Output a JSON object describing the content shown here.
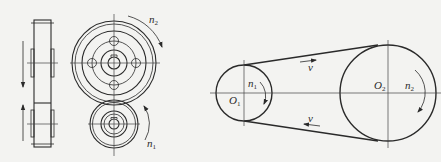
{
  "figure": {
    "colors": {
      "background": "#f3f3f1",
      "ink": "#2a2a2a"
    },
    "gear_pair": {
      "side_view": {
        "arrows": [
          {
            "direction": "down"
          },
          {
            "direction": "up"
          }
        ]
      },
      "front_view": {
        "large_gear": {
          "speed_label": "n",
          "speed_sub": "2",
          "rotation": "clockwise"
        },
        "small_gear": {
          "speed_label": "n",
          "speed_sub": "1",
          "rotation": "counterclockwise"
        }
      }
    },
    "belt_drive": {
      "driver_pulley": {
        "center_label": "O",
        "center_sub": "1",
        "speed_label": "n",
        "speed_sub": "1",
        "rotation": "clockwise"
      },
      "driven_pulley": {
        "center_label": "O",
        "center_sub": "2",
        "speed_label": "n",
        "speed_sub": "2",
        "rotation": "clockwise"
      },
      "top_belt_velocity": {
        "label": "v",
        "direction": "right"
      },
      "bottom_belt_velocity": {
        "label": "v",
        "direction": "left"
      }
    }
  }
}
